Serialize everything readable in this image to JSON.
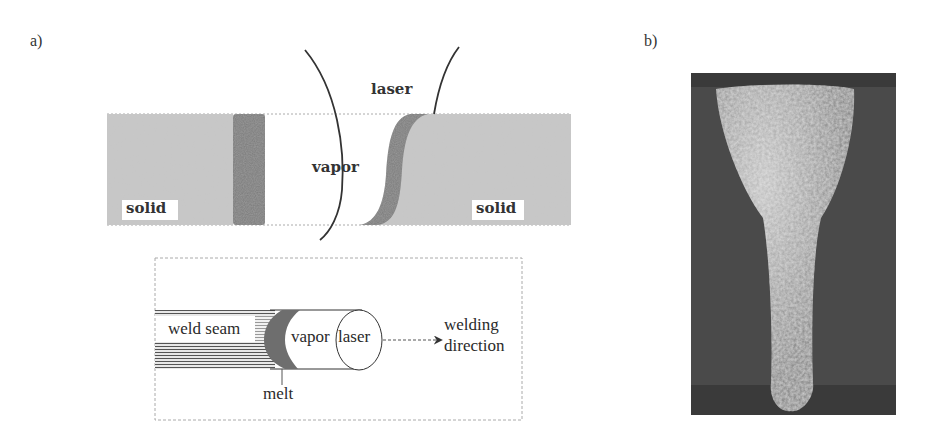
{
  "panels": {
    "a": {
      "label": "a)",
      "cross_section": {
        "solid_left_label": "solid",
        "solid_right_label": "solid",
        "vapor_label": "vapor",
        "laser_label": "laser"
      },
      "top_view": {
        "weld_seam_label": "weld seam",
        "melt_label": "melt",
        "vapor_label": "vapor",
        "laser_label": "laser",
        "direction_label_line1": "welding",
        "direction_label_line2": "direction"
      }
    },
    "b": {
      "label": "b)"
    }
  },
  "colors": {
    "solid": "#c8c8c8",
    "melt": "#7a7a7a",
    "outline": "#333333",
    "photo_bg": "#4a4a4a",
    "photo_weld": "#a8a8a8"
  }
}
